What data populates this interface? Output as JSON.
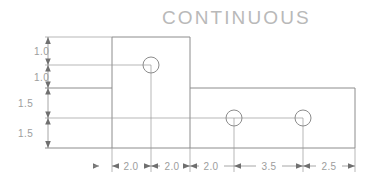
{
  "drawing": {
    "title": "CONTINUOUS",
    "title_color": "#b9b9b9",
    "line_color": "#8c8c8c",
    "dim_color": "#9d9d9d",
    "background": "#ffffff",
    "vertical_dimensions": [
      {
        "id": "v1",
        "label": "1.0"
      },
      {
        "id": "v2",
        "label": "1.0"
      },
      {
        "id": "v3",
        "label": "1.5"
      },
      {
        "id": "v4",
        "label": "1.5"
      }
    ],
    "horizontal_dimensions": [
      {
        "id": "h1",
        "label": "2.0"
      },
      {
        "id": "h2",
        "label": "2.0"
      },
      {
        "id": "h3",
        "label": "2.0"
      },
      {
        "id": "h4",
        "label": "3.5"
      },
      {
        "id": "h5",
        "label": "2.5"
      }
    ],
    "holes": [
      {
        "id": "hole-1",
        "cx": 151,
        "cy": 65,
        "r": 8
      },
      {
        "id": "hole-2",
        "cx": 234,
        "cy": 118,
        "r": 8
      },
      {
        "id": "hole-3",
        "cx": 303,
        "cy": 118,
        "r": 8
      }
    ]
  }
}
